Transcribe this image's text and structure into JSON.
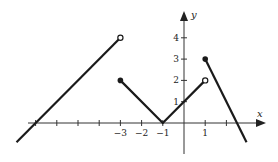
{
  "chart_data": {
    "type": "line",
    "title": "",
    "xlabel": "x",
    "ylabel": "y",
    "xlim": [
      -8,
      3.5
    ],
    "ylim": [
      -1.3,
      5.2
    ],
    "grid": false,
    "x_ticks": [
      -7,
      -6,
      -5,
      -4,
      -3,
      -2,
      -1,
      1,
      2
    ],
    "x_tick_labels": [
      {
        "value": -3,
        "label": "−3"
      },
      {
        "value": -2,
        "label": "−2"
      },
      {
        "value": -1,
        "label": "−1"
      },
      {
        "value": 1,
        "label": "1"
      }
    ],
    "y_ticks": [
      1,
      2,
      3,
      4
    ],
    "y_tick_labels": [
      {
        "value": 1,
        "label": "1"
      },
      {
        "value": 2,
        "label": "2"
      },
      {
        "value": 3,
        "label": "3"
      },
      {
        "value": 4,
        "label": "4"
      }
    ],
    "series": [
      {
        "name": "piece-1",
        "points": [
          [
            -7.9,
            -0.9
          ],
          [
            -3,
            4
          ]
        ],
        "start_marker": "none",
        "end_marker": "open"
      },
      {
        "name": "piece-2",
        "points": [
          [
            -3,
            2
          ],
          [
            -1,
            0
          ],
          [
            1,
            2
          ]
        ],
        "start_marker": "closed",
        "end_marker": "open"
      },
      {
        "name": "piece-3",
        "points": [
          [
            1,
            3
          ],
          [
            2.95,
            -0.9
          ]
        ],
        "start_marker": "closed",
        "end_marker": "none"
      }
    ],
    "color": "#1a1a1a"
  }
}
